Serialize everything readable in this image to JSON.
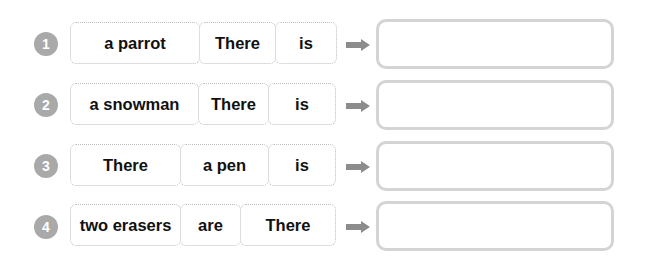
{
  "exercise": {
    "rows": [
      {
        "number": "1",
        "words": [
          "a parrot",
          "There",
          "is"
        ],
        "answer": ""
      },
      {
        "number": "2",
        "words": [
          "a snowman",
          "There",
          "is"
        ],
        "answer": ""
      },
      {
        "number": "3",
        "words": [
          "There",
          "a pen",
          "is"
        ],
        "answer": ""
      },
      {
        "number": "4",
        "words": [
          "two erasers",
          "are",
          "There"
        ],
        "answer": ""
      }
    ]
  },
  "colors": {
    "number_badge": "#a9a9a9",
    "arrow": "#8c8c8c",
    "answer_border": "#d4d4d4",
    "card_border": "#bdbdbd"
  }
}
